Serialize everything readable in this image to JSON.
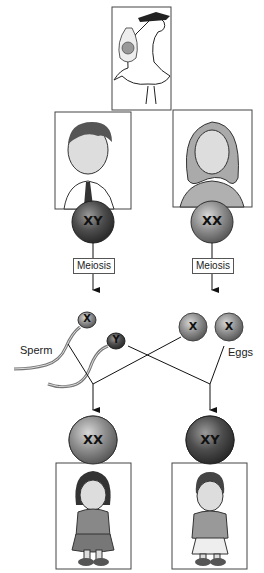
{
  "diagram": {
    "type": "sex-determination-inheritance",
    "stork_frame": {
      "icon": "stork-delivering-baby"
    },
    "parents": [
      {
        "role": "father",
        "chromosomes": "XY"
      },
      {
        "role": "mother",
        "chromosomes": "XX"
      }
    ],
    "process_labels": {
      "left": "Meiosis",
      "right": "Meiosis"
    },
    "gametes": {
      "sperm_label": "Sperm",
      "eggs_label": "Eggs",
      "sperm": [
        "X",
        "Y"
      ],
      "eggs": [
        "X",
        "X"
      ]
    },
    "offspring": [
      {
        "role": "girl",
        "chromosomes": "XX"
      },
      {
        "role": "boy",
        "chromosomes": "XY"
      }
    ],
    "colors": {
      "xy_sphere": "#4a4a4a",
      "xx_sphere": "#8a8a8a",
      "gamete_sphere": "#9a9a9a",
      "line": "#111111"
    }
  }
}
